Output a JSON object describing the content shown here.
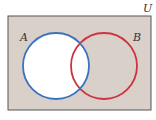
{
  "diagram": {
    "type": "venn",
    "universe_label": "U",
    "sets": [
      {
        "label": "A",
        "stroke": "#3a72c0",
        "fill": "#ffffff",
        "shaded": false
      },
      {
        "label": "B",
        "stroke": "#cc3340",
        "fill": "none",
        "shaded": false
      }
    ],
    "shaded_region": "A (unshaded); complement of A shaded",
    "colors": {
      "universe_fill": "#d9d0c9",
      "universe_border": "#555555",
      "set_a": "#3a72c0",
      "set_b": "#cc3340"
    }
  }
}
